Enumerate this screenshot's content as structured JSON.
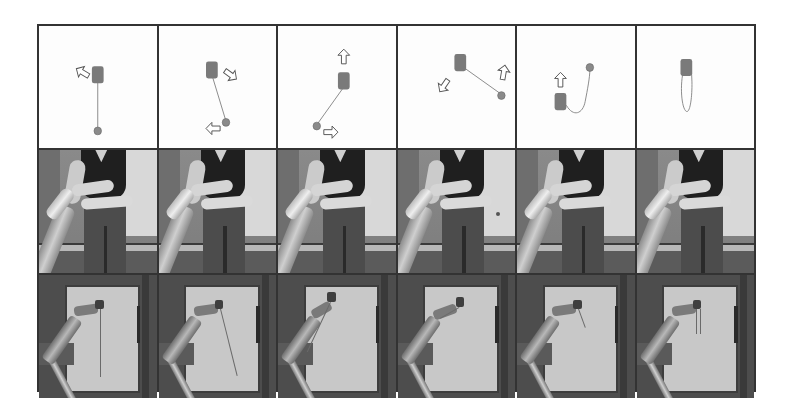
{
  "figure": {
    "layout": {
      "rows": 3,
      "columns": 6
    },
    "rows": [
      {
        "name": "diagram",
        "description": "Schematic of yo-yo (cylinder) and ball connected by string with motion arrows"
      },
      {
        "name": "human-demonstration",
        "description": "Human performing the motion with a robotic arm in frame"
      },
      {
        "name": "robot-execution",
        "description": "Robot arm executing the motion in front of a board"
      }
    ],
    "diagram_panels": [
      {
        "step": 1,
        "cylinder": [
          50,
          40
        ],
        "ball": [
          50,
          86
        ],
        "string": "straight",
        "arrows": [
          {
            "dir": "up-left",
            "at": [
              36,
              38
            ]
          }
        ]
      },
      {
        "step": 2,
        "cylinder": [
          45,
          37
        ],
        "ball": [
          57,
          79
        ],
        "string": "straight",
        "arrows": [
          {
            "dir": "down-right",
            "at": [
              60,
              40
            ]
          },
          {
            "dir": "left",
            "at": [
              46,
              84
            ]
          }
        ]
      },
      {
        "step": 3,
        "cylinder": [
          56,
          45
        ],
        "ball": [
          33,
          82
        ],
        "string": "straight",
        "arrows": [
          {
            "dir": "up",
            "at": [
              56,
              25
            ]
          },
          {
            "dir": "right",
            "at": [
              45,
              87
            ]
          }
        ]
      },
      {
        "step": 4,
        "cylinder": [
          53,
          30
        ],
        "ball": [
          88,
          56
        ],
        "string": "straight",
        "arrows": [
          {
            "dir": "down-left",
            "at": [
              39,
              49
            ]
          },
          {
            "dir": "up",
            "at": [
              90,
              37
            ]
          }
        ]
      },
      {
        "step": 5,
        "cylinder": [
          37,
          62
        ],
        "ball": [
          62,
          34
        ],
        "string": "curled",
        "arrows": [
          {
            "dir": "up",
            "at": [
              37,
              44
            ]
          }
        ]
      },
      {
        "step": 6,
        "cylinder": [
          42,
          34
        ],
        "ball": null,
        "string": "loop",
        "arrows": []
      }
    ],
    "colors": {
      "border": "#333333",
      "cylinder": "#7a7a7a",
      "ball": "#8a8a8a",
      "string": "#888888",
      "arrow_outline": "#666666"
    }
  }
}
